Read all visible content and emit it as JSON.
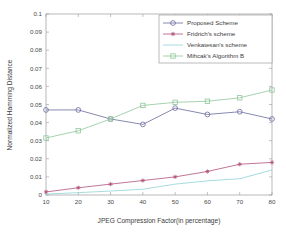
{
  "chart_data": {
    "type": "line",
    "title": "",
    "xlabel": "JPEG Compression Factor(in percentage)",
    "ylabel": "Normalized Hamming Distance",
    "x": [
      10,
      20,
      30,
      40,
      50,
      60,
      70,
      80
    ],
    "xlim": [
      10,
      80
    ],
    "ylim": [
      0,
      0.1
    ],
    "xticks": [
      "10",
      "20",
      "30",
      "40",
      "50",
      "60",
      "70",
      "80"
    ],
    "yticks": [
      "0",
      "0.01",
      "0.02",
      "0.03",
      "0.04",
      "0.05",
      "0.06",
      "0.07",
      "0.08",
      "0.09",
      "0.1"
    ],
    "ytick_values": [
      0,
      0.01,
      0.02,
      0.03,
      0.04,
      0.05,
      0.06,
      0.07,
      0.08,
      0.09,
      0.1
    ],
    "grid": false,
    "legend_position": "upper right",
    "series": [
      {
        "name": "Proposed Scheme",
        "marker": "circle",
        "color": "#6b6b9e",
        "values": [
          0.047,
          0.047,
          0.042,
          0.039,
          0.048,
          0.0445,
          0.046,
          0.042
        ]
      },
      {
        "name": "Fridrich's scheme",
        "marker": "asterisk",
        "color": "#b0527a",
        "values": [
          0.0017,
          0.004,
          0.006,
          0.008,
          0.01,
          0.013,
          0.017,
          0.018
        ]
      },
      {
        "name": "Venkatesan's scheme",
        "marker": "none",
        "color": "#8fd2d8",
        "values": [
          0.0005,
          0.0013,
          0.0022,
          0.0032,
          0.006,
          0.0078,
          0.009,
          0.0138
        ]
      },
      {
        "name": "Mihcak's Algorithm B",
        "marker": "square",
        "color": "#8fc79a",
        "values": [
          0.0315,
          0.0355,
          0.042,
          0.0495,
          0.0512,
          0.0518,
          0.0537,
          0.058
        ]
      }
    ]
  },
  "figure": {
    "background": "#ffffff",
    "axis_color": "#9a9a9a"
  }
}
